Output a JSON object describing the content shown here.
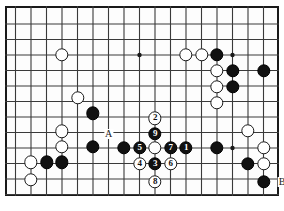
{
  "figure": {
    "kind": "go-board-diagram",
    "caption": "",
    "width": 284,
    "height": 211
  },
  "board": {
    "origin_x": 15.5,
    "origin_y": 16,
    "spacing": 15.5,
    "cols": 17,
    "rows": 12,
    "frame": {
      "left": 5,
      "top": 6,
      "width": 274,
      "height": 190
    },
    "line_color": "#3a3a3a",
    "border_color": "#1a1a1a",
    "background_color": "#fdfdfd"
  },
  "colors": {
    "black_stone": "#111111",
    "white_stone": "#ffffff",
    "stone_outline": "#1a1a1a",
    "black_number_text": "#ffffff",
    "white_number_text": "#111111",
    "label_text": "#1a1a1a"
  },
  "star_points": [
    {
      "col": 8,
      "row": 2.52
    },
    {
      "col": 14,
      "row": 2.52
    },
    {
      "col": 14,
      "row": 8.52
    }
  ],
  "stones": [
    {
      "color": "white",
      "col": 3,
      "row": 2.52,
      "number": null
    },
    {
      "color": "white",
      "col": 11,
      "row": 2.52,
      "number": null
    },
    {
      "color": "white",
      "col": 12,
      "row": 2.52,
      "number": null
    },
    {
      "color": "black",
      "col": 13,
      "row": 2.52,
      "number": null
    },
    {
      "color": "white",
      "col": 13,
      "row": 3.55,
      "number": null
    },
    {
      "color": "black",
      "col": 14,
      "row": 3.55,
      "number": null
    },
    {
      "color": "black",
      "col": 16,
      "row": 3.55,
      "number": null
    },
    {
      "color": "white",
      "col": 13,
      "row": 4.58,
      "number": null
    },
    {
      "color": "black",
      "col": 14,
      "row": 4.58,
      "number": null
    },
    {
      "color": "white",
      "col": 13,
      "row": 5.61,
      "number": null
    },
    {
      "color": "white",
      "col": 4,
      "row": 5.28,
      "number": null
    },
    {
      "color": "black",
      "col": 5,
      "row": 6.28,
      "number": null
    },
    {
      "color": "white",
      "col": 9,
      "row": 6.6,
      "number": "2"
    },
    {
      "color": "black",
      "col": 9,
      "row": 7.6,
      "number": "9"
    },
    {
      "color": "white",
      "col": 15,
      "row": 7.4,
      "number": null
    },
    {
      "color": "white",
      "col": 3,
      "row": 7.45,
      "number": null
    },
    {
      "color": "white",
      "col": 3,
      "row": 8.45,
      "number": null
    },
    {
      "color": "black",
      "col": 5,
      "row": 8.45,
      "number": null
    },
    {
      "color": "black",
      "col": 7,
      "row": 8.52,
      "number": null
    },
    {
      "color": "black",
      "col": 8,
      "row": 8.52,
      "number": "5"
    },
    {
      "color": "white",
      "col": 9,
      "row": 8.52,
      "number": null
    },
    {
      "color": "black",
      "col": 10,
      "row": 8.52,
      "number": "7"
    },
    {
      "color": "black",
      "col": 11,
      "row": 8.52,
      "number": "1"
    },
    {
      "color": "black",
      "col": 13,
      "row": 8.52,
      "number": null
    },
    {
      "color": "white",
      "col": 16,
      "row": 8.52,
      "number": null
    },
    {
      "color": "white",
      "col": 1,
      "row": 9.45,
      "number": null
    },
    {
      "color": "black",
      "col": 2,
      "row": 9.45,
      "number": null
    },
    {
      "color": "black",
      "col": 3,
      "row": 9.45,
      "number": null
    },
    {
      "color": "white",
      "col": 8,
      "row": 9.55,
      "number": "4"
    },
    {
      "color": "black",
      "col": 9,
      "row": 9.55,
      "number": "3"
    },
    {
      "color": "white",
      "col": 10,
      "row": 9.55,
      "number": "6"
    },
    {
      "color": "black",
      "col": 15,
      "row": 9.55,
      "number": null
    },
    {
      "color": "white",
      "col": 16,
      "row": 9.55,
      "number": null
    },
    {
      "color": "white",
      "col": 1,
      "row": 10.55,
      "number": null
    },
    {
      "color": "white",
      "col": 9,
      "row": 10.7,
      "number": "8"
    },
    {
      "color": "black",
      "col": 16,
      "row": 10.7,
      "number": null
    }
  ],
  "labels": [
    {
      "text": "A",
      "col": 6,
      "row": 7.6
    },
    {
      "text": "B",
      "col": 17.2,
      "row": 10.7
    }
  ]
}
